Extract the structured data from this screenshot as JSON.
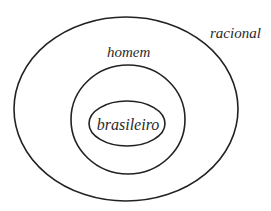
{
  "diagram": {
    "type": "euler-diagram",
    "sets": [
      {
        "id": "outer",
        "label": "racional",
        "ellipse": {
          "cx": 126,
          "cy": 109,
          "rx": 112,
          "ry": 92
        },
        "label_pos": {
          "x": 210,
          "y": 38
        }
      },
      {
        "id": "middle",
        "label": "homem",
        "ellipse": {
          "cx": 128,
          "cy": 119.5,
          "rx": 57,
          "ry": 54.5
        },
        "label_pos": {
          "x": 130,
          "y": 57
        }
      },
      {
        "id": "inner",
        "label": "brasileiro",
        "ellipse": {
          "cx": 127,
          "cy": 123.5,
          "rx": 38,
          "ry": 22.5
        },
        "label_pos": {
          "x": 128,
          "y": 130
        }
      }
    ],
    "colors": {
      "stroke": "#222222",
      "text": "#2a2a2a",
      "background": "#ffffff"
    }
  }
}
